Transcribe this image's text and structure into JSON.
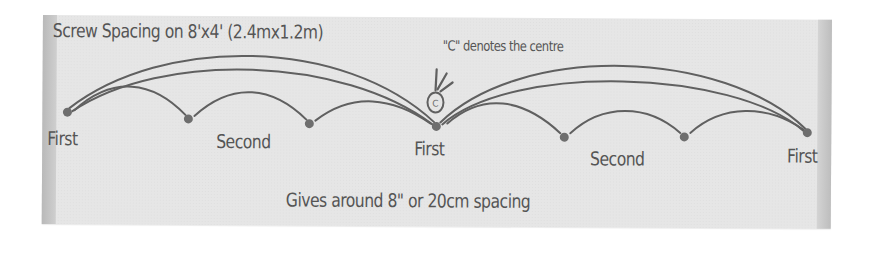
{
  "diagram": {
    "title": "Screw Spacing on 8'x4' (2.4mx1.2m)",
    "centre_note": "\"C\" denotes the centre",
    "centre_marker": "C",
    "footer": "Gives  around 8\" or 20cm spacing",
    "screws": [
      {
        "label": "First",
        "x": 25,
        "y": 97
      },
      {
        "label": "Second",
        "x": 146,
        "y": 103
      },
      {
        "label": "",
        "x": 267,
        "y": 107
      },
      {
        "label": "First",
        "x": 394,
        "y": 109
      },
      {
        "label": "Second",
        "x": 522,
        "y": 119
      },
      {
        "label": "",
        "x": 642,
        "y": 118
      },
      {
        "label": "First",
        "x": 765,
        "y": 113
      }
    ],
    "labels": [
      {
        "text": "First",
        "x": 7,
        "y": 113
      },
      {
        "text": "Second",
        "x": 174,
        "y": 115
      },
      {
        "text": "First",
        "x": 372,
        "y": 121
      },
      {
        "text": "Second",
        "x": 548,
        "y": 130
      },
      {
        "text": "First",
        "x": 745,
        "y": 126
      }
    ],
    "colors": {
      "panel": "#e6e6e6",
      "ink": "#555555",
      "dot": "#6e6e6e"
    }
  }
}
